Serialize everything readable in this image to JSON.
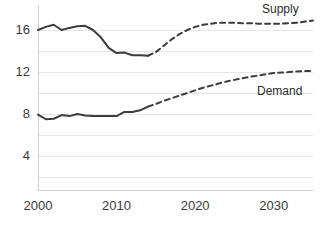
{
  "chart_data": {
    "type": "line",
    "title": "",
    "subtitle": "",
    "xlabel": "",
    "ylabel": "",
    "xlim": [
      2000,
      2035
    ],
    "ylim": [
      0,
      17.5
    ],
    "grid": true,
    "gridlines_y": [
      2,
      4,
      6,
      8,
      10,
      12,
      14,
      16
    ],
    "y_ticks": [
      "16",
      "12",
      "8",
      "4"
    ],
    "y_tick_values": [
      16,
      12,
      8,
      4
    ],
    "x_ticks": [
      "2000",
      "2010",
      "2020",
      "2030"
    ],
    "x_tick_values": [
      2000,
      2010,
      2020,
      2030
    ],
    "legend_position": "inline-right",
    "line_color": "#3c3c3c",
    "grid_color": "#e6e6e6",
    "axis_color": "#cfcfcf",
    "series": [
      {
        "name": "Supply",
        "label": "Supply",
        "style_history": "solid",
        "style_forecast": "dashed",
        "history_end_year": 2014,
        "x": [
          2000,
          2001,
          2002,
          2003,
          2004,
          2005,
          2006,
          2007,
          2008,
          2009,
          2010,
          2011,
          2012,
          2013,
          2014,
          2015,
          2016,
          2017,
          2018,
          2019,
          2020,
          2021,
          2022,
          2023,
          2024,
          2025,
          2026,
          2027,
          2028,
          2029,
          2030,
          2031,
          2032,
          2033,
          2034,
          2035
        ],
        "values": [
          16.0,
          16.3,
          16.5,
          16.0,
          16.2,
          16.35,
          16.4,
          16.0,
          15.3,
          14.3,
          13.8,
          13.85,
          13.6,
          13.6,
          13.55,
          13.9,
          14.5,
          15.1,
          15.6,
          16.0,
          16.3,
          16.5,
          16.6,
          16.7,
          16.7,
          16.7,
          16.65,
          16.65,
          16.6,
          16.6,
          16.6,
          16.6,
          16.65,
          16.7,
          16.8,
          16.9
        ]
      },
      {
        "name": "Demand",
        "label": "Demand",
        "style_history": "solid",
        "style_forecast": "dashed",
        "history_end_year": 2014,
        "x": [
          2000,
          2001,
          2002,
          2003,
          2004,
          2005,
          2006,
          2007,
          2008,
          2009,
          2010,
          2011,
          2012,
          2013,
          2014,
          2015,
          2016,
          2017,
          2018,
          2019,
          2020,
          2021,
          2022,
          2023,
          2024,
          2025,
          2026,
          2027,
          2028,
          2029,
          2030,
          2031,
          2032,
          2033,
          2034,
          2035
        ],
        "values": [
          7.95,
          7.5,
          7.55,
          7.9,
          7.8,
          8.0,
          7.85,
          7.8,
          7.8,
          7.8,
          7.8,
          8.2,
          8.2,
          8.35,
          8.7,
          8.95,
          9.25,
          9.5,
          9.75,
          10.0,
          10.25,
          10.5,
          10.7,
          10.9,
          11.1,
          11.25,
          11.4,
          11.55,
          11.65,
          11.8,
          11.9,
          11.95,
          12.0,
          12.05,
          12.1,
          12.1
        ]
      }
    ]
  },
  "labels": {
    "supply": "Supply",
    "demand": "Demand"
  },
  "ticks": {
    "y": [
      "16",
      "12",
      "8",
      "4"
    ],
    "x": [
      "2000",
      "2010",
      "2020",
      "2030"
    ]
  }
}
